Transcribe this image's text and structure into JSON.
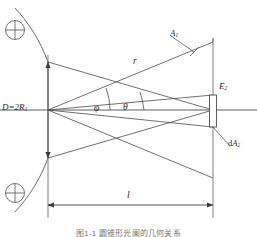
{
  "figure": {
    "caption": "图1-1  圆锥形光阑的几何关系",
    "background_color": "#ffffff",
    "line_color": "#4d4d4d",
    "label_color": "#2b2b2b"
  },
  "labels": {
    "aperture_diameter": {
      "text": "D=2R",
      "subscript": "1",
      "name": "aperture-diameter-label"
    },
    "ray_length": {
      "text": "r",
      "name": "ray-length-label"
    },
    "source_area": {
      "text": "A",
      "subscript": "1",
      "name": "source-area-label"
    },
    "angle_phi": {
      "text": "φ",
      "name": "angle-phi-label"
    },
    "angle_theta": {
      "text": "θ",
      "name": "angle-theta-label"
    },
    "irradiance": {
      "text": "E",
      "subscript": "2",
      "name": "irradiance-label"
    },
    "detector_area": {
      "text": "dA",
      "subscript": "2",
      "prefix": "d",
      "base": "A",
      "name": "detector-area-label"
    },
    "distance": {
      "text": "l",
      "name": "distance-label"
    }
  },
  "symbols": {
    "top_crossed_circle": "crossed-circle",
    "bottom_crossed_circle": "crossed-circle"
  },
  "geometry": {
    "axis_y": 110,
    "left_plane_x": 48,
    "right_plane_x": 213,
    "aperture_top_y": 62,
    "aperture_bottom_y": 158,
    "detector_top_y": 95,
    "detector_bottom_y": 127,
    "dimension_line_y": 205,
    "distance_l_px": 165,
    "diameter_d_px": 96
  }
}
